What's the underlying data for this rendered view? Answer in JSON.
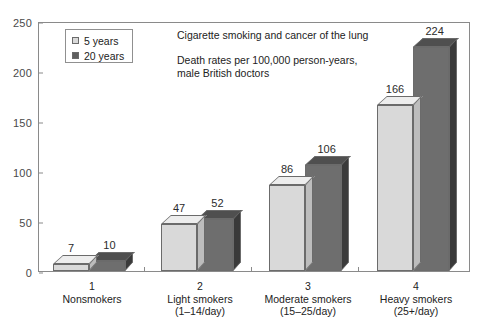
{
  "chart_data": {
    "type": "bar",
    "title": "Cigarette smoking and cancer of the lung",
    "subtitle_line1": "Death rates per 100,000 person-years,",
    "subtitle_line2": "male British doctors",
    "xlabel": "",
    "ylabel": "",
    "ylim": [
      0,
      250
    ],
    "yticks": [
      0,
      50,
      100,
      150,
      200,
      250
    ],
    "grid": false,
    "legend_position": "top-left",
    "categories": [
      "Nonsmokers",
      "Light smokers",
      "Moderate smokers",
      "Heavy smokers"
    ],
    "category_numbers": [
      "1",
      "2",
      "3",
      "4"
    ],
    "category_ranges": [
      "",
      "(1–14/day)",
      "(15–25/day)",
      "(25+/day)"
    ],
    "series": [
      {
        "name": "5 years",
        "values": [
          7,
          47,
          86,
          166
        ]
      },
      {
        "name": "20 years",
        "values": [
          10,
          52,
          106,
          224
        ]
      }
    ]
  },
  "yaxis": {
    "t0": "0",
    "t1": "50",
    "t2": "100",
    "t3": "150",
    "t4": "200",
    "t5": "250"
  },
  "legend": {
    "item0_label": "5 years",
    "item1_label": "20 years"
  },
  "annotation": {
    "title": "Cigarette smoking and cancer of the lung",
    "line1": "Death rates per 100,000 person-years,",
    "line2": "male British doctors"
  },
  "groups": [
    {
      "num": "1",
      "name": "Nonsmokers",
      "range": "",
      "light_label": "7",
      "dark_label": "10"
    },
    {
      "num": "2",
      "name": "Light smokers",
      "range": "(1–14/day)",
      "light_label": "47",
      "dark_label": "52"
    },
    {
      "num": "3",
      "name": "Moderate smokers",
      "range": "(15–25/day)",
      "light_label": "86",
      "dark_label": "106"
    },
    {
      "num": "4",
      "name": "Heavy smokers",
      "range": "(25+/day)",
      "light_label": "166",
      "dark_label": "224"
    }
  ],
  "colors": {
    "series_5_years": "#d9d9d9",
    "series_20_years": "#6e6e6e",
    "axis": "#8a8a8a",
    "text": "#222222",
    "background": "#ffffff"
  }
}
